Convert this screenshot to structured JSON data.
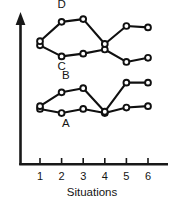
{
  "chart_data": {
    "type": "line",
    "title": "",
    "subtitle": "",
    "xlabel": "Situations",
    "ylabel": "",
    "categories": [
      "1",
      "2",
      "3",
      "4",
      "5",
      "6"
    ],
    "x": [
      1,
      2,
      3,
      4,
      5,
      6
    ],
    "xlim": [
      0.6,
      6.4
    ],
    "ylim": [
      0,
      100
    ],
    "grid": false,
    "legend_position": "inline-labels",
    "axis_style": {
      "y_axis_arrow": true,
      "x_axis_arrow": false,
      "y_tick_labels": false,
      "x_tick_labels": true
    },
    "series": [
      {
        "name": "A",
        "label": "A",
        "label_position": "below-left",
        "values": [
          40,
          37,
          40,
          37,
          41,
          42
        ],
        "marker": "open-circle",
        "color": "#101010"
      },
      {
        "name": "B",
        "label": "B",
        "label_position": "above",
        "values": [
          42,
          52,
          55,
          38,
          59,
          59
        ],
        "marker": "open-circle",
        "color": "#101010"
      },
      {
        "name": "C",
        "label": "C",
        "label_position": "below",
        "values": [
          86,
          78,
          80,
          83,
          74,
          77
        ],
        "marker": "open-circle",
        "color": "#101010"
      },
      {
        "name": "D",
        "label": "D",
        "label_position": "above",
        "values": [
          89,
          103,
          105,
          87,
          100,
          99
        ],
        "marker": "open-circle",
        "color": "#101010"
      }
    ],
    "annotations": [
      {
        "text": "D",
        "x": 2.0,
        "y": 113
      },
      {
        "text": "C",
        "x": 2.0,
        "y": 68
      },
      {
        "text": "B",
        "x": 2.2,
        "y": 62
      },
      {
        "text": "A",
        "x": 2.2,
        "y": 27
      }
    ],
    "colors": {
      "line": "#101010",
      "axis": "#181818",
      "marker_fill": "#ffffff",
      "background": "#ffffff",
      "text": "#141414"
    }
  }
}
